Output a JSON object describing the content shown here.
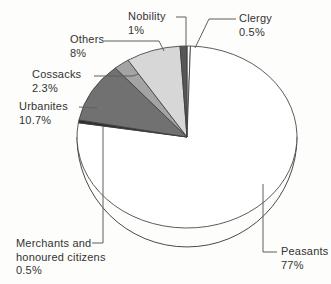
{
  "figure": {
    "background": "#fdfdfb",
    "outline_color": "#3f3f3f",
    "leader_line_color": "#5f5f5f",
    "text_color": "#333333"
  },
  "chart_data": {
    "type": "pie",
    "style": "3d-outline-grayscale",
    "title": "",
    "unit": "%",
    "start_angle_deg": 0,
    "direction": "clockwise",
    "legend_position": "outside-callouts",
    "slices": [
      {
        "label": "Clergy",
        "pct_label": "0.5%",
        "value": 0.5,
        "color": "#ffffff"
      },
      {
        "label": "Peasants",
        "pct_label": "77%",
        "value": 77,
        "color": "#ffffff"
      },
      {
        "label": "Merchants and honoured citizens",
        "pct_label": "0.5%",
        "value": 0.5,
        "color": "#2d2d2d"
      },
      {
        "label": "Urbanites",
        "pct_label": "10.7%",
        "value": 10.7,
        "color": "#717171"
      },
      {
        "label": "Cossacks",
        "pct_label": "2.3%",
        "value": 2.3,
        "color": "#a4a4a4"
      },
      {
        "label": "Others",
        "pct_label": "8%",
        "value": 8,
        "color": "#d7d7d7"
      },
      {
        "label": "Nobility",
        "pct_label": "1%",
        "value": 1,
        "color": "#565656"
      }
    ]
  }
}
